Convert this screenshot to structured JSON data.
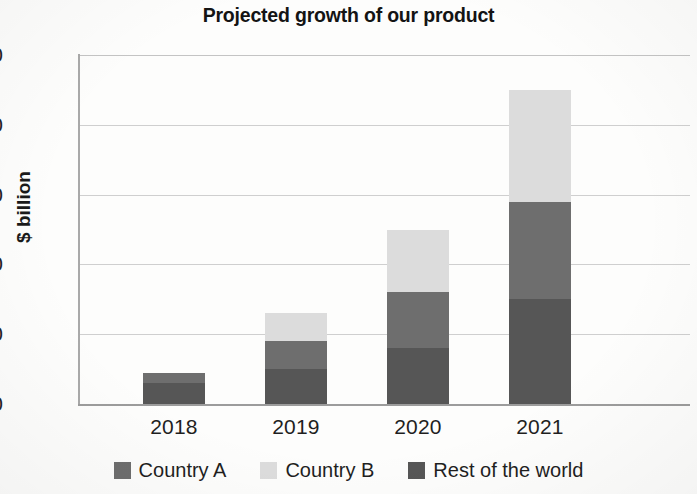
{
  "chart_data": {
    "type": "bar",
    "subtype": "stacked-bar",
    "title": "Projected growth of our product",
    "subtitle": "",
    "xlabel": "",
    "ylabel": "$ billion",
    "categories": [
      "2018",
      "2019",
      "2020",
      "2021"
    ],
    "ylim": [
      0,
      50
    ],
    "yticks": [
      0,
      10,
      20,
      30,
      40,
      50
    ],
    "ytick_labels": [
      "0",
      "10",
      "20",
      "30",
      "40",
      "50"
    ],
    "grid": true,
    "grid_axis": "y",
    "legend_position": "bottom",
    "stack_order_bottom_to_top": [
      "Rest of the world",
      "Country A",
      "Country B"
    ],
    "series": [
      {
        "name": "Country A",
        "color": "#6e6e6e",
        "values": [
          1.5,
          4.0,
          8.0,
          14.0
        ]
      },
      {
        "name": "Country B",
        "color": "#dcdcdc",
        "values": [
          0.0,
          4.0,
          9.0,
          16.0
        ]
      },
      {
        "name": "Rest of the world",
        "color": "#565656",
        "values": [
          3.0,
          5.0,
          8.0,
          15.0
        ]
      }
    ],
    "totals": [
      4.5,
      13.0,
      25.0,
      45.0
    ],
    "annotations": []
  },
  "legend": {
    "items": [
      {
        "label": "Country A",
        "swatch": "legend-swatch-country-a",
        "color": "#6e6e6e"
      },
      {
        "label": "Country B",
        "swatch": "legend-swatch-country-b",
        "color": "#dcdcdc"
      },
      {
        "label": "Rest of the world",
        "swatch": "legend-swatch-rest-of-world",
        "color": "#565656"
      }
    ]
  },
  "axes": {
    "y_title": "$ billion",
    "y_tick_labels": [
      "50",
      "40",
      "30",
      "20",
      "10",
      "0"
    ],
    "x_tick_labels": [
      "2018",
      "2019",
      "2020",
      "2021"
    ]
  },
  "colors": {
    "country_a": "#6e6e6e",
    "country_b": "#dcdcdc",
    "rest_of_world": "#565656",
    "gridline": "#cfcfcf",
    "axis": "#9c9c9c",
    "text": "#1f1f1f",
    "background": "#fdfdfc"
  }
}
